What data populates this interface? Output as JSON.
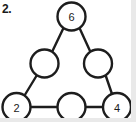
{
  "question": {
    "number_label": "2."
  },
  "diagram": {
    "type": "triangle-number-puzzle",
    "shape": "triangle",
    "stroke_color": "#1d1d1d",
    "fill_color": "#ffffff",
    "background_color": "#ffffff",
    "edge_shade_color": "#e9e9e9",
    "nodes": [
      {
        "id": "apex",
        "name": "top-vertex",
        "value": "6",
        "filled": true,
        "cx": 71.5,
        "cy": 16.5,
        "r": 14
      },
      {
        "id": "left-mid",
        "name": "left-edge-midpoint",
        "value": "",
        "filled": false,
        "cx": 44.5,
        "cy": 63.5,
        "r": 14
      },
      {
        "id": "right-mid",
        "name": "right-edge-midpoint",
        "value": "",
        "filled": false,
        "cx": 98.0,
        "cy": 63.5,
        "r": 14
      },
      {
        "id": "bottom-left",
        "name": "bottom-left-vertex",
        "value": "2",
        "filled": true,
        "cx": 16.5,
        "cy": 107.0,
        "r": 14
      },
      {
        "id": "bottom-mid",
        "name": "bottom-edge-midpoint",
        "value": "",
        "filled": false,
        "cx": 71.5,
        "cy": 107.0,
        "r": 14
      },
      {
        "id": "bottom-right",
        "name": "bottom-right-vertex",
        "value": "4",
        "filled": true,
        "cx": 117.0,
        "cy": 107.0,
        "r": 14
      }
    ],
    "edges": [
      {
        "from": "apex",
        "to": "left-mid",
        "x1": 63.5,
        "y1": 28.0,
        "x2": 52.0,
        "y2": 52.0
      },
      {
        "from": "left-mid",
        "to": "bottom-left",
        "x1": 37.0,
        "y1": 75.0,
        "x2": 24.5,
        "y2": 95.5
      },
      {
        "from": "apex",
        "to": "right-mid",
        "x1": 79.5,
        "y1": 28.0,
        "x2": 90.5,
        "y2": 52.0
      },
      {
        "from": "right-mid",
        "to": "bottom-right",
        "x1": 105.5,
        "y1": 75.0,
        "x2": 112.0,
        "y2": 94.0
      },
      {
        "from": "bottom-left",
        "to": "bottom-mid",
        "x1": 30.5,
        "y1": 107.0,
        "x2": 57.5,
        "y2": 107.0
      },
      {
        "from": "bottom-mid",
        "to": "bottom-right",
        "x1": 85.5,
        "y1": 107.0,
        "x2": 103.0,
        "y2": 107.0
      }
    ]
  }
}
